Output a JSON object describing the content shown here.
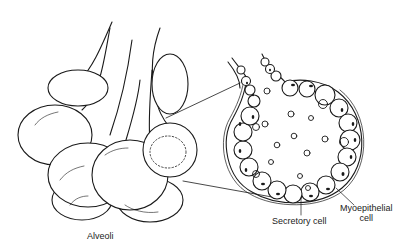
{
  "diagram": {
    "labels": {
      "alveoli": "Alveoli",
      "secretory_cell": "Secretory cell",
      "myoepithelial_line1": "Myoepithelial",
      "myoepithelial_line2": "cell"
    },
    "colors": {
      "ink": "#1a1a1a",
      "background": "#ffffff"
    },
    "parts": [
      "alveoli-cluster",
      "ducts",
      "magnified-alveolus",
      "secretory-cells",
      "myoepithelial-layer",
      "milk-droplets",
      "callout-lines"
    ]
  }
}
